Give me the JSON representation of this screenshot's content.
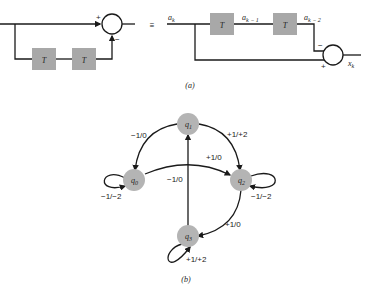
{
  "figure_a": {
    "caption": "(a)",
    "equiv_symbol": "≡",
    "left": {
      "delay_blocks": [
        "T",
        "T"
      ],
      "summer_signs": {
        "top_input": "+",
        "bottom_input": "−"
      }
    },
    "right": {
      "input_label": "a",
      "input_sub": "k",
      "delay_blocks": [
        "T",
        "T"
      ],
      "mid_label": "a",
      "mid_sub": "k − 1",
      "delayed_label": "a",
      "delayed_sub": "k − 2",
      "summer_signs": {
        "top_input": "−",
        "bottom_input": "+"
      },
      "output_label": "x",
      "output_sub": "k"
    }
  },
  "figure_b": {
    "caption": "(b)",
    "states": [
      {
        "id": "q0",
        "label": "q",
        "sub": "0"
      },
      {
        "id": "q1",
        "label": "q",
        "sub": "1"
      },
      {
        "id": "q2",
        "label": "q",
        "sub": "2"
      },
      {
        "id": "q3",
        "label": "q",
        "sub": "3"
      }
    ],
    "transitions": [
      {
        "from": "q1",
        "to": "q0",
        "label": "−1/0"
      },
      {
        "from": "q1",
        "to": "q2",
        "label": "+1/+2"
      },
      {
        "from": "q0",
        "to": "q2",
        "label": "+1/0"
      },
      {
        "from": "q3",
        "to": "q1",
        "label": "−1/0"
      },
      {
        "from": "q0",
        "to": "q0",
        "label": "−1/−2"
      },
      {
        "from": "q2",
        "to": "q2",
        "label": "−1/−2"
      },
      {
        "from": "q2",
        "to": "q3",
        "label": "+1/0"
      },
      {
        "from": "q3",
        "to": "q3",
        "label": "+1/+2"
      }
    ]
  },
  "colors": {
    "block_fill": "#a8a8a8",
    "node_fill": "#b4b4b4",
    "line": "#1a1a1a"
  }
}
